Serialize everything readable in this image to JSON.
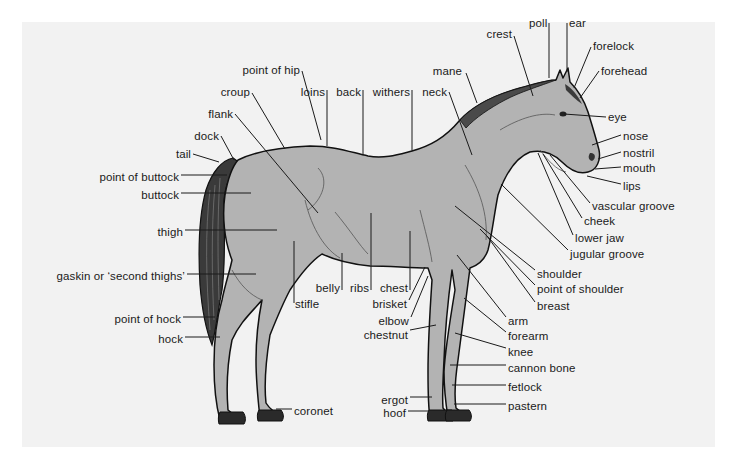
{
  "diagram": {
    "colors": {
      "panel": "#f2f2f2",
      "body": "#b3b3b3",
      "outline": "#111111",
      "tail": "#3a3a3a",
      "label": "#1a1a1a"
    },
    "labels": [
      {
        "id": "poll",
        "text": "poll",
        "x": 529,
        "y": 17,
        "align": "l",
        "line": [
          [
            549,
            23
          ],
          [
            549,
            78
          ]
        ]
      },
      {
        "id": "ear",
        "text": "ear",
        "x": 569,
        "y": 17,
        "align": "l",
        "line": [
          [
            567,
            23
          ],
          [
            567,
            72
          ]
        ]
      },
      {
        "id": "crest",
        "text": "crest",
        "x": 512,
        "y": 28,
        "align": "r",
        "line": [
          [
            514,
            36
          ],
          [
            533,
            96
          ]
        ]
      },
      {
        "id": "forelock",
        "text": "forelock",
        "x": 593,
        "y": 40,
        "align": "l",
        "line": [
          [
            591,
            47
          ],
          [
            574,
            88
          ]
        ]
      },
      {
        "id": "mane",
        "text": "mane",
        "x": 462,
        "y": 65,
        "align": "r",
        "line": [
          [
            466,
            73
          ],
          [
            477,
            103
          ]
        ]
      },
      {
        "id": "forehead",
        "text": "forehead",
        "x": 601,
        "y": 65,
        "align": "l",
        "line": [
          [
            599,
            71
          ],
          [
            580,
            98
          ]
        ]
      },
      {
        "id": "point-of-hip",
        "text": "point of hip",
        "x": 300,
        "y": 64,
        "align": "r",
        "line": [
          [
            302,
            71
          ],
          [
            321,
            140
          ]
        ]
      },
      {
        "id": "croup",
        "text": "croup",
        "x": 250,
        "y": 86,
        "align": "r",
        "line": [
          [
            252,
            93
          ],
          [
            285,
            149
          ]
        ]
      },
      {
        "id": "loins",
        "text": "loins",
        "x": 325,
        "y": 86,
        "align": "r",
        "line": [
          [
            327,
            90
          ],
          [
            327,
            146
          ]
        ]
      },
      {
        "id": "back",
        "text": "back",
        "x": 361,
        "y": 86,
        "align": "r",
        "line": [
          [
            363,
            90
          ],
          [
            363,
            155
          ]
        ]
      },
      {
        "id": "withers",
        "text": "withers",
        "x": 410,
        "y": 86,
        "align": "r",
        "line": [
          [
            412,
            90
          ],
          [
            412,
            151
          ]
        ]
      },
      {
        "id": "neck",
        "text": "neck",
        "x": 447,
        "y": 86,
        "align": "r",
        "line": [
          [
            449,
            92
          ],
          [
            472,
            155
          ]
        ]
      },
      {
        "id": "flank",
        "text": "flank",
        "x": 233,
        "y": 108,
        "align": "r",
        "line": [
          [
            235,
            114
          ],
          [
            318,
            213
          ]
        ]
      },
      {
        "id": "eye",
        "text": "eye",
        "x": 608,
        "y": 111,
        "align": "l",
        "line": [
          [
            606,
            117
          ],
          [
            564,
            114
          ]
        ]
      },
      {
        "id": "dock",
        "text": "dock",
        "x": 219,
        "y": 130,
        "align": "r",
        "line": [
          [
            221,
            136
          ],
          [
            234,
            160
          ]
        ]
      },
      {
        "id": "nose",
        "text": "nose",
        "x": 623,
        "y": 130,
        "align": "l",
        "line": [
          [
            621,
            135
          ],
          [
            592,
            145
          ]
        ]
      },
      {
        "id": "nostril",
        "text": "nostril",
        "x": 623,
        "y": 147,
        "align": "l",
        "line": [
          [
            621,
            152
          ],
          [
            598,
            159
          ]
        ]
      },
      {
        "id": "tail",
        "text": "tail",
        "x": 191,
        "y": 148,
        "align": "r",
        "line": [
          [
            193,
            154
          ],
          [
            219,
            162
          ]
        ]
      },
      {
        "id": "mouth",
        "text": "mouth",
        "x": 623,
        "y": 162,
        "align": "l",
        "line": [
          [
            621,
            167
          ],
          [
            595,
            169
          ]
        ]
      },
      {
        "id": "point-of-buttock",
        "text": "point of buttock",
        "x": 179,
        "y": 171,
        "align": "r",
        "line": [
          [
            181,
            175
          ],
          [
            227,
            175
          ]
        ]
      },
      {
        "id": "lips",
        "text": "lips",
        "x": 623,
        "y": 180,
        "align": "l",
        "line": [
          [
            621,
            184
          ],
          [
            587,
            176
          ]
        ]
      },
      {
        "id": "buttock",
        "text": "buttock",
        "x": 179,
        "y": 189,
        "align": "r",
        "line": [
          [
            181,
            193
          ],
          [
            251,
            193
          ]
        ]
      },
      {
        "id": "vascular-groove",
        "text": "vascular groove",
        "x": 592,
        "y": 200,
        "align": "l",
        "line": [
          [
            590,
            203
          ],
          [
            550,
            155
          ]
        ]
      },
      {
        "id": "thigh",
        "text": "thigh",
        "x": 183,
        "y": 226,
        "align": "r",
        "line": [
          [
            185,
            230
          ],
          [
            277,
            230
          ]
        ]
      },
      {
        "id": "cheek",
        "text": "cheek",
        "x": 584,
        "y": 215,
        "align": "l",
        "line": [
          [
            582,
            218
          ],
          [
            543,
            154
          ]
        ]
      },
      {
        "id": "lower-jaw",
        "text": "lower jaw",
        "x": 575,
        "y": 232,
        "align": "l",
        "line": [
          [
            573,
            235
          ],
          [
            538,
            153
          ]
        ]
      },
      {
        "id": "jugular-groove",
        "text": "jugular groove",
        "x": 570,
        "y": 248,
        "align": "l",
        "line": [
          [
            568,
            250
          ],
          [
            501,
            184
          ]
        ]
      },
      {
        "id": "gaskin",
        "text": "gaskin or ‘second thighs’",
        "x": 185,
        "y": 270,
        "align": "r",
        "line": [
          [
            187,
            274
          ],
          [
            256,
            274
          ]
        ]
      },
      {
        "id": "shoulder",
        "text": "shoulder",
        "x": 537,
        "y": 268,
        "align": "l",
        "line": [
          [
            535,
            270
          ],
          [
            455,
            206
          ]
        ]
      },
      {
        "id": "belly",
        "text": "belly",
        "x": 340,
        "y": 282,
        "align": "r",
        "line": [
          [
            342,
            290
          ],
          [
            342,
            253
          ]
        ]
      },
      {
        "id": "ribs",
        "text": "ribs",
        "x": 369,
        "y": 282,
        "align": "r",
        "line": [
          [
            371,
            290
          ],
          [
            371,
            213
          ]
        ]
      },
      {
        "id": "chest",
        "text": "chest",
        "x": 408,
        "y": 282,
        "align": "r",
        "line": [
          [
            410,
            290
          ],
          [
            410,
            231
          ]
        ]
      },
      {
        "id": "point-of-shoulder",
        "text": "point of shoulder",
        "x": 537,
        "y": 283,
        "align": "l",
        "line": [
          [
            535,
            285
          ],
          [
            480,
            229
          ]
        ]
      },
      {
        "id": "stifle",
        "text": "stifle",
        "x": 295,
        "y": 298,
        "align": "l",
        "line": [
          [
            294,
            303
          ],
          [
            294,
            241
          ]
        ]
      },
      {
        "id": "brisket",
        "text": "brisket",
        "x": 407,
        "y": 298,
        "align": "r",
        "line": [
          [
            409,
            300
          ],
          [
            425,
            267
          ]
        ]
      },
      {
        "id": "breast",
        "text": "breast",
        "x": 537,
        "y": 300,
        "align": "l",
        "line": [
          [
            535,
            302
          ],
          [
            487,
            236
          ]
        ]
      },
      {
        "id": "point-of-hock",
        "text": "point of hock",
        "x": 181,
        "y": 313,
        "align": "r",
        "line": [
          [
            183,
            317
          ],
          [
            215,
            317
          ]
        ]
      },
      {
        "id": "elbow",
        "text": "elbow",
        "x": 409,
        "y": 315,
        "align": "r",
        "line": [
          [
            411,
            317
          ],
          [
            428,
            276
          ]
        ]
      },
      {
        "id": "arm",
        "text": "arm",
        "x": 508,
        "y": 315,
        "align": "l",
        "line": [
          [
            506,
            317
          ],
          [
            457,
            255
          ]
        ]
      },
      {
        "id": "chestnut",
        "text": "chestnut",
        "x": 408,
        "y": 329,
        "align": "r",
        "line": [
          [
            410,
            330
          ],
          [
            436,
            325
          ]
        ]
      },
      {
        "id": "hock",
        "text": "hock",
        "x": 183,
        "y": 333,
        "align": "r",
        "line": [
          [
            185,
            337
          ],
          [
            220,
            337
          ]
        ]
      },
      {
        "id": "forearm",
        "text": "forearm",
        "x": 508,
        "y": 330,
        "align": "l",
        "line": [
          [
            506,
            332
          ],
          [
            464,
            298
          ]
        ]
      },
      {
        "id": "knee",
        "text": "knee",
        "x": 508,
        "y": 346,
        "align": "l",
        "line": [
          [
            506,
            348
          ],
          [
            455,
            333
          ]
        ]
      },
      {
        "id": "cannon-bone",
        "text": "cannon bone",
        "x": 508,
        "y": 362,
        "align": "l",
        "line": [
          [
            506,
            365
          ],
          [
            450,
            365
          ]
        ]
      },
      {
        "id": "fetlock",
        "text": "fetlock",
        "x": 508,
        "y": 381,
        "align": "l",
        "line": [
          [
            506,
            385
          ],
          [
            452,
            385
          ]
        ]
      },
      {
        "id": "coronet",
        "text": "coronet",
        "x": 294,
        "y": 405,
        "align": "l",
        "line": [
          [
            292,
            409
          ],
          [
            276,
            409
          ]
        ]
      },
      {
        "id": "ergot",
        "text": "ergot",
        "x": 408,
        "y": 394,
        "align": "r",
        "line": [
          [
            410,
            397
          ],
          [
            432,
            397
          ]
        ]
      },
      {
        "id": "pastern",
        "text": "pastern",
        "x": 508,
        "y": 400,
        "align": "l",
        "line": [
          [
            506,
            404
          ],
          [
            454,
            404
          ]
        ]
      },
      {
        "id": "hoof",
        "text": "hoof",
        "x": 406,
        "y": 407,
        "align": "r",
        "line": [
          [
            408,
            411
          ],
          [
            428,
            411
          ]
        ]
      }
    ]
  }
}
